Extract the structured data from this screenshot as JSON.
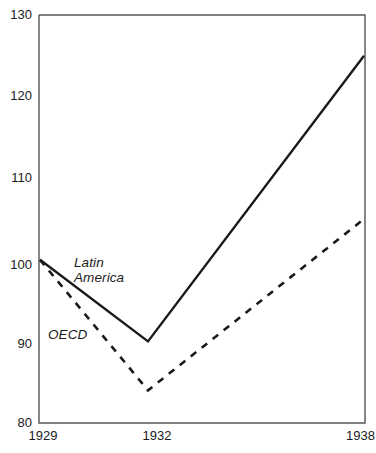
{
  "chart_data": {
    "type": "line",
    "title": "",
    "subtitle": "",
    "xlabel": "",
    "ylabel": "",
    "x": [
      1929,
      1932,
      1938
    ],
    "xtick_labels": [
      "1929",
      "1932",
      "1938"
    ],
    "ytick_labels": [
      "80",
      "90",
      "100",
      "110",
      "120",
      "130"
    ],
    "yticks": [
      80,
      90,
      100,
      110,
      120,
      130
    ],
    "ylim": [
      80,
      130
    ],
    "grid": false,
    "legend_position": "inline-annotations",
    "series": [
      {
        "name": "Latin America",
        "label_text": "Latin\nAmerica",
        "style": "solid",
        "color": "#1a1a1a",
        "values": [
          100,
          90,
          125
        ]
      },
      {
        "name": "OECD",
        "label_text": "OECD",
        "style": "dashed",
        "color": "#1a1a1a",
        "values": [
          100,
          84,
          105
        ]
      }
    ]
  },
  "axis": {
    "frame_color": "#555555",
    "y_labels": {
      "t130": "130",
      "t120": "120",
      "t110": "110",
      "t100": "100",
      "t90": "90",
      "t80": "80"
    },
    "x_labels": {
      "x1929": "1929",
      "x1932": "1932",
      "x1938": "1938"
    }
  },
  "annotations": {
    "latin_america": "Latin\nAmerica",
    "oecd": "OECD"
  }
}
